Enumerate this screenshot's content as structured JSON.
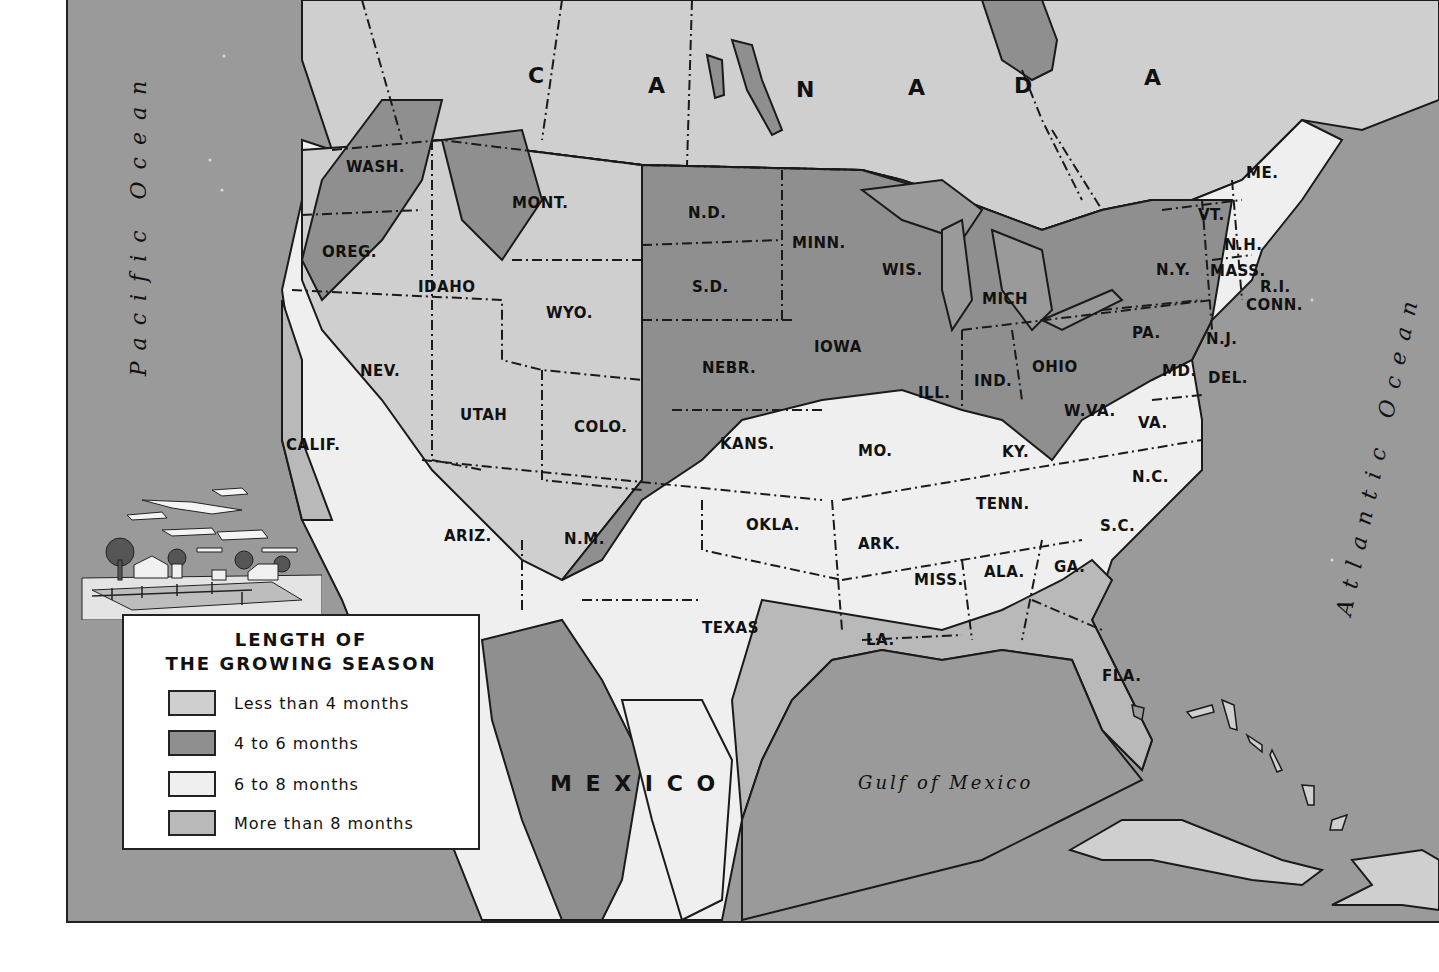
{
  "colors": {
    "ocean": "#9a9a9a",
    "less_than_4": "#cfcfcf",
    "four_to_6": "#8f8f8f",
    "six_to_8": "#efefef",
    "more_than_8": "#b9b9b9",
    "line": "#1a1a1a"
  },
  "legend": {
    "title_line1": "LENGTH OF",
    "title_line2": "THE GROWING SEASON",
    "items": [
      {
        "label": "Less than 4 months",
        "color": "#cfcfcf"
      },
      {
        "label": "4 to 6 months",
        "color": "#8f8f8f"
      },
      {
        "label": "6 to 8 months",
        "color": "#efefef"
      },
      {
        "label": "More than 8 months",
        "color": "#b9b9b9"
      }
    ]
  },
  "countries": {
    "canada_letters": [
      "C",
      "A",
      "N",
      "A",
      "D",
      "A"
    ],
    "mexico": "M E X I C O"
  },
  "water_bodies": {
    "pacific": "Pacific Ocean",
    "atlantic": "Atlantic Ocean",
    "gulf": "Gulf of Mexico"
  },
  "states": [
    {
      "abbr": "WASH.",
      "x": 344,
      "y": 158
    },
    {
      "abbr": "OREG.",
      "x": 320,
      "y": 243
    },
    {
      "abbr": "CALIF.",
      "x": 284,
      "y": 436
    },
    {
      "abbr": "NEV.",
      "x": 358,
      "y": 362
    },
    {
      "abbr": "IDAHO",
      "x": 416,
      "y": 278
    },
    {
      "abbr": "MONT.",
      "x": 510,
      "y": 194
    },
    {
      "abbr": "WYO.",
      "x": 544,
      "y": 304
    },
    {
      "abbr": "UTAH",
      "x": 458,
      "y": 406
    },
    {
      "abbr": "COLO.",
      "x": 572,
      "y": 418
    },
    {
      "abbr": "ARIZ.",
      "x": 442,
      "y": 527
    },
    {
      "abbr": "N.M.",
      "x": 562,
      "y": 530
    },
    {
      "abbr": "N.D.",
      "x": 686,
      "y": 204
    },
    {
      "abbr": "S.D.",
      "x": 690,
      "y": 278
    },
    {
      "abbr": "NEBR.",
      "x": 700,
      "y": 359
    },
    {
      "abbr": "KANS.",
      "x": 718,
      "y": 435
    },
    {
      "abbr": "OKLA.",
      "x": 744,
      "y": 516
    },
    {
      "abbr": "TEXAS",
      "x": 700,
      "y": 619
    },
    {
      "abbr": "MINN.",
      "x": 790,
      "y": 234
    },
    {
      "abbr": "IOWA",
      "x": 812,
      "y": 338
    },
    {
      "abbr": "MO.",
      "x": 856,
      "y": 442
    },
    {
      "abbr": "ARK.",
      "x": 856,
      "y": 535
    },
    {
      "abbr": "LA.",
      "x": 864,
      "y": 631
    },
    {
      "abbr": "WIS.",
      "x": 880,
      "y": 261
    },
    {
      "abbr": "ILL.",
      "x": 916,
      "y": 384
    },
    {
      "abbr": "MICH",
      "x": 980,
      "y": 290
    },
    {
      "abbr": "IND.",
      "x": 972,
      "y": 372
    },
    {
      "abbr": "OHIO",
      "x": 1030,
      "y": 358
    },
    {
      "abbr": "KY.",
      "x": 1000,
      "y": 443
    },
    {
      "abbr": "TENN.",
      "x": 974,
      "y": 495
    },
    {
      "abbr": "MISS.",
      "x": 912,
      "y": 571
    },
    {
      "abbr": "ALA.",
      "x": 982,
      "y": 563
    },
    {
      "abbr": "GA.",
      "x": 1052,
      "y": 558
    },
    {
      "abbr": "FLA.",
      "x": 1100,
      "y": 667
    },
    {
      "abbr": "S.C.",
      "x": 1098,
      "y": 517
    },
    {
      "abbr": "N.C.",
      "x": 1130,
      "y": 468
    },
    {
      "abbr": "VA.",
      "x": 1136,
      "y": 414
    },
    {
      "abbr": "W.VA.",
      "x": 1062,
      "y": 402
    },
    {
      "abbr": "MD.",
      "x": 1160,
      "y": 362
    },
    {
      "abbr": "DEL.",
      "x": 1206,
      "y": 369
    },
    {
      "abbr": "PA.",
      "x": 1130,
      "y": 324
    },
    {
      "abbr": "N.J.",
      "x": 1204,
      "y": 330
    },
    {
      "abbr": "N.Y.",
      "x": 1154,
      "y": 261
    },
    {
      "abbr": "CONN.",
      "x": 1244,
      "y": 296
    },
    {
      "abbr": "R.I.",
      "x": 1258,
      "y": 278
    },
    {
      "abbr": "MASS.",
      "x": 1208,
      "y": 262
    },
    {
      "abbr": "N.H.",
      "x": 1222,
      "y": 236
    },
    {
      "abbr": "VT.",
      "x": 1196,
      "y": 206
    },
    {
      "abbr": "ME.",
      "x": 1244,
      "y": 164
    }
  ]
}
